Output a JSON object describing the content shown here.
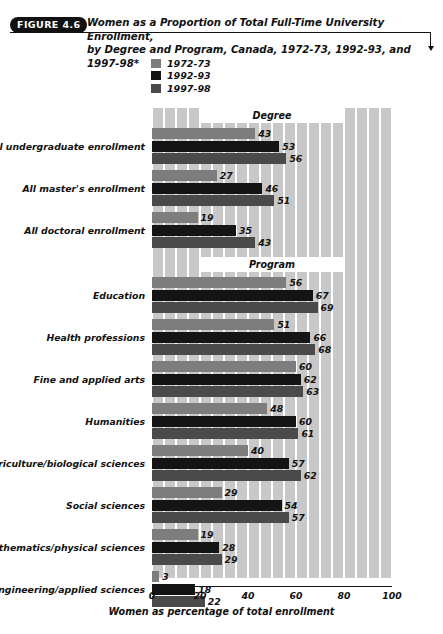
{
  "figure": {
    "badge": "FIGURE 4.6",
    "title_line1": "Women as a Proportion of Total Full-Time University Enrollment,",
    "title_line2": "by Degree and Program, Canada, 1972-73, 1992-93, and 1997-98*"
  },
  "legend": {
    "entries": [
      {
        "label": "1972-73",
        "color": "#7d7d7d"
      },
      {
        "label": "1992-93",
        "color": "#141414"
      },
      {
        "label": "1997-98",
        "color": "#4a4a4a"
      }
    ]
  },
  "sections": [
    {
      "label": "Degree"
    },
    {
      "label": "Program"
    }
  ],
  "axis": {
    "ticks": [
      "0",
      "20",
      "40",
      "60",
      "80",
      "100"
    ],
    "title": "Women as percentage of total enrollment"
  },
  "chart_data": {
    "type": "bar",
    "orientation": "horizontal",
    "title": "Women as a Proportion of Total Full-Time University Enrollment, by Degree and Program, Canada, 1972-73, 1992-93, and 1997-98*",
    "xlabel": "Women as percentage of total enrollment",
    "ylabel": "",
    "xlim": [
      0,
      100
    ],
    "xticks": [
      0,
      20,
      40,
      60,
      80,
      100
    ],
    "grid": "vertical-bands",
    "legend_position": "above-plot-left",
    "group_headers": [
      "Degree",
      "Program"
    ],
    "categories": [
      "All undergraduate enrollment",
      "All master's enrollment",
      "All doctoral enrollment",
      "Education",
      "Health professions",
      "Fine and applied arts",
      "Humanities",
      "Agriculture/biological sciences",
      "Social sciences",
      "Mathematics/physical sciences",
      "Engineering/applied sciences"
    ],
    "category_groups": [
      "Degree",
      "Degree",
      "Degree",
      "Program",
      "Program",
      "Program",
      "Program",
      "Program",
      "Program",
      "Program",
      "Program"
    ],
    "series": [
      {
        "name": "1972-73",
        "color": "#7d7d7d",
        "values": [
          43,
          27,
          19,
          56,
          51,
          60,
          48,
          40,
          29,
          19,
          3
        ]
      },
      {
        "name": "1992-93",
        "color": "#141414",
        "values": [
          53,
          46,
          35,
          67,
          66,
          62,
          60,
          57,
          54,
          28,
          18
        ]
      },
      {
        "name": "1997-98",
        "color": "#4a4a4a",
        "values": [
          56,
          51,
          43,
          69,
          68,
          63,
          61,
          62,
          57,
          29,
          22
        ]
      }
    ]
  }
}
